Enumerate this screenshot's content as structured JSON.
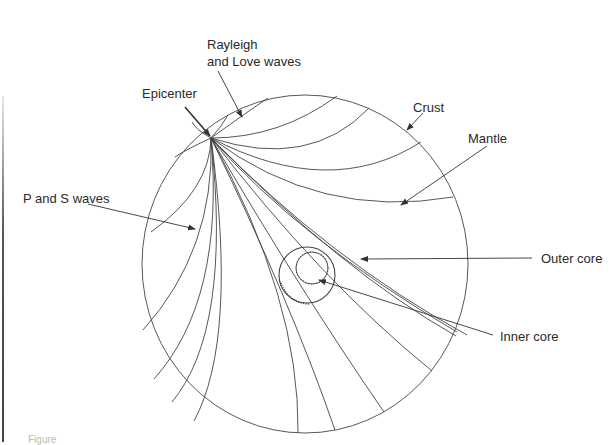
{
  "diagram": {
    "labels": {
      "rayleigh_line1": "Rayleigh",
      "rayleigh_line2": "and Love waves",
      "epicenter": "Epicenter",
      "crust": "Crust",
      "mantle": "Mantle",
      "p_and_s": "P and S waves",
      "outer_core": "Outer core",
      "inner_core": "Inner core"
    },
    "caption": "Figure",
    "colors": {
      "stroke": "#333333",
      "text": "#2a2a2a",
      "background": "#ffffff"
    },
    "geometry": {
      "earth": {
        "cx": 305,
        "cy": 264,
        "rx": 163,
        "ry": 169
      },
      "outer_core": {
        "cx": 307,
        "cy": 275,
        "r": 28
      },
      "inner_core": {
        "cx": 312,
        "cy": 268,
        "r": 16
      },
      "epicenter": {
        "x": 211,
        "y": 138
      }
    },
    "nodes": [
      "Epicenter",
      "Crust",
      "Mantle",
      "Outer core",
      "Inner core",
      "Rayleigh and Love waves",
      "P and S waves"
    ],
    "edges": [
      {
        "from": "Epicenter",
        "to": "Crust",
        "label": "surface waves travel along crust"
      },
      {
        "from": "Epicenter",
        "to": "Mantle",
        "label": "body waves curve through mantle"
      },
      {
        "from": "Epicenter",
        "to": "Outer core",
        "label": "waves refract at core boundary"
      }
    ]
  }
}
